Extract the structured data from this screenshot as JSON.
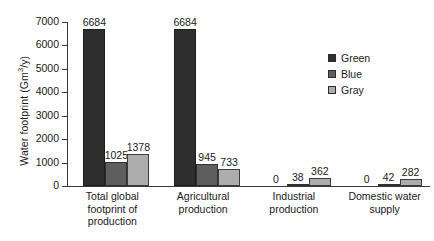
{
  "chart_data": {
    "type": "bar",
    "title": "",
    "subtitle": "",
    "xlabel": "",
    "ylabel": "Water footprint (Gm3/y)",
    "ylabel_prefix": "Water footprint (Gm",
    "ylabel_sup": "3",
    "ylabel_suffix": "/y)",
    "ylim": [
      0,
      7000
    ],
    "ytick_step": 1000,
    "yticks": [
      "7000",
      "6000",
      "5000",
      "4000",
      "3000",
      "2000",
      "1000",
      "0"
    ],
    "ytick_values": [
      7000,
      6000,
      5000,
      4000,
      3000,
      2000,
      1000,
      0
    ],
    "grid": false,
    "legend_position": "right",
    "categories": [
      "Total global footprint of production",
      "Agricultural production",
      "Industrial production",
      "Domestic water supply"
    ],
    "category_lines": [
      [
        "Total global",
        "footprint of",
        "production"
      ],
      [
        "Agricultural",
        "production"
      ],
      [
        "Industrial",
        "production"
      ],
      [
        "Domestic water",
        "supply"
      ]
    ],
    "series": [
      {
        "name": "Green",
        "color": "#2e2e2e",
        "values": [
          6684,
          6684,
          0,
          0
        ],
        "labels": [
          "6684",
          "6684",
          "0",
          "0"
        ]
      },
      {
        "name": "Blue",
        "color": "#5e5e5e",
        "values": [
          1025,
          945,
          38,
          42
        ],
        "labels": [
          "1025",
          "945",
          "38",
          "42"
        ]
      },
      {
        "name": "Gray",
        "color": "#adadad",
        "values": [
          1378,
          733,
          362,
          282
        ],
        "labels": [
          "1378",
          "733",
          "362",
          "282"
        ]
      }
    ]
  },
  "legend": {
    "items": [
      {
        "label": "Green",
        "color": "#2e2e2e"
      },
      {
        "label": "Blue",
        "color": "#5e5e5e"
      },
      {
        "label": "Gray",
        "color": "#adadad"
      }
    ]
  }
}
